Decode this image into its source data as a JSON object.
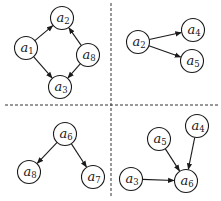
{
  "diagram": {
    "colors": {
      "stroke": "#1a1a1a",
      "background": "#ffffff",
      "divider": "#333333"
    },
    "node_radius": 11.5,
    "dividers": [
      {
        "orientation": "vertical",
        "x1": 111,
        "y1": 3,
        "x2": 111,
        "y2": 198
      },
      {
        "orientation": "horizontal",
        "x1": 5,
        "y1": 105,
        "x2": 218,
        "y2": 105
      }
    ],
    "panels": [
      {
        "name": "top-left",
        "nodes": [
          {
            "id": "a2",
            "base": "a",
            "sub": "2",
            "x": 62,
            "y": 18
          },
          {
            "id": "a1",
            "base": "a",
            "sub": "1",
            "x": 26,
            "y": 48
          },
          {
            "id": "a8",
            "base": "a",
            "sub": "8",
            "x": 88,
            "y": 55
          },
          {
            "id": "a3",
            "base": "a",
            "sub": "3",
            "x": 60,
            "y": 87
          }
        ],
        "edges": [
          {
            "from": "a1",
            "to": "a2"
          },
          {
            "from": "a1",
            "to": "a3"
          },
          {
            "from": "a8",
            "to": "a2"
          },
          {
            "from": "a8",
            "to": "a3"
          }
        ]
      },
      {
        "name": "top-right",
        "nodes": [
          {
            "id": "a2",
            "base": "a",
            "sub": "2",
            "x": 138,
            "y": 42
          },
          {
            "id": "a4",
            "base": "a",
            "sub": "4",
            "x": 193,
            "y": 30
          },
          {
            "id": "a5",
            "base": "a",
            "sub": "5",
            "x": 192,
            "y": 61
          }
        ],
        "edges": [
          {
            "from": "a2",
            "to": "a4"
          },
          {
            "from": "a2",
            "to": "a5"
          }
        ]
      },
      {
        "name": "bottom-left",
        "nodes": [
          {
            "id": "a6",
            "base": "a",
            "sub": "6",
            "x": 65,
            "y": 134
          },
          {
            "id": "a8",
            "base": "a",
            "sub": "8",
            "x": 29,
            "y": 172
          },
          {
            "id": "a7",
            "base": "a",
            "sub": "7",
            "x": 93,
            "y": 177
          }
        ],
        "edges": [
          {
            "from": "a6",
            "to": "a8"
          },
          {
            "from": "a6",
            "to": "a7"
          }
        ]
      },
      {
        "name": "bottom-right",
        "nodes": [
          {
            "id": "a4",
            "base": "a",
            "sub": "4",
            "x": 197,
            "y": 126
          },
          {
            "id": "a5",
            "base": "a",
            "sub": "5",
            "x": 159,
            "y": 139
          },
          {
            "id": "a3",
            "base": "a",
            "sub": "3",
            "x": 131,
            "y": 179
          },
          {
            "id": "a6",
            "base": "a",
            "sub": "6",
            "x": 186,
            "y": 181
          }
        ],
        "edges": [
          {
            "from": "a5",
            "to": "a6"
          },
          {
            "from": "a4",
            "to": "a6"
          },
          {
            "from": "a3",
            "to": "a6"
          }
        ]
      }
    ]
  }
}
